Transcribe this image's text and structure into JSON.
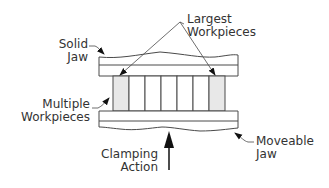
{
  "diagram": {
    "labels": {
      "solid_jaw": "Solid\nJaw",
      "largest_workpieces": "Largest\nWorkpieces",
      "multiple_workpieces": "Multiple\nWorkpieces",
      "moveable_jaw": "Moveable\nJaw",
      "clamping_action": "Clamping\nAction"
    },
    "workpieces": {
      "count": 7,
      "shaded": [
        0,
        6
      ]
    },
    "colors": {
      "line": "#4a4a4a",
      "shade": "#e8e8e8",
      "text": "#333333",
      "arrow": "#111111"
    }
  }
}
